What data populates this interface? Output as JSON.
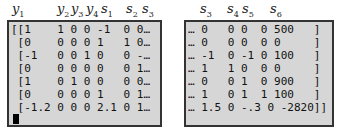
{
  "left_panel": {
    "headers": [
      {
        "var": "y",
        "sub": "1",
        "x": 12
      },
      {
        "var": "y",
        "sub": "2",
        "x": 57
      },
      {
        "var": "y",
        "sub": "3",
        "x": 71
      },
      {
        "var": "y",
        "sub": "4",
        "x": 86
      },
      {
        "var": "s",
        "sub": "1",
        "x": 101
      },
      {
        "var": "s",
        "sub": "2",
        "x": 126
      },
      {
        "var": "s",
        "sub": "3",
        "x": 142
      }
    ],
    "rows": [
      "[[1    1 0 0 -1  0 0…",
      " [0    0 0 0 1   1 0…",
      " [-1   0 0 1 0   0 -…",
      " [0    0 0 0 0   0 1…",
      " [1    0 1 0 0   0 0…",
      " [0    0 0 0 1   0 1…",
      " [-1.2 0 0 0 2.1 0 1…"
    ]
  },
  "right_panel": {
    "headers": [
      {
        "var": "s",
        "sub": "3",
        "x": 200
      },
      {
        "var": "s",
        "sub": "4",
        "x": 227
      },
      {
        "var": "s",
        "sub": "5",
        "x": 242
      },
      {
        "var": "s",
        "sub": "6",
        "x": 270
      }
    ],
    "rows": [
      "… 0   0 0  0 500   ]",
      "… 0   0 0  0 0     ]",
      "… -1  0 -1 0 100   ]",
      "… 1   1 0  0 0     ]",
      "… 0   0 1  0 900   ]",
      "… 1   0 1  1 100   ]",
      "… 1.5 0 -.3 0 -2820]]"
    ]
  }
}
